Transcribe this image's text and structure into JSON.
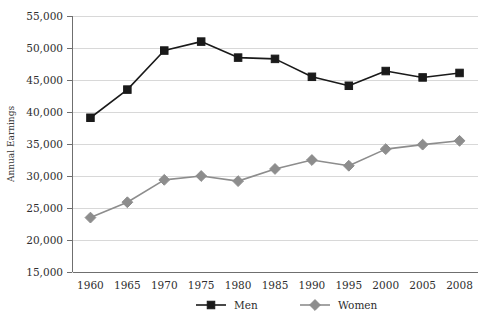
{
  "chart_data": {
    "type": "line",
    "title": "",
    "xlabel": "",
    "ylabel": "Annual Earnings",
    "x": [
      "1960",
      "1965",
      "1970",
      "1975",
      "1980",
      "1985",
      "1990",
      "1995",
      "2000",
      "2005",
      "2008"
    ],
    "categories": [
      "1960",
      "1965",
      "1970",
      "1975",
      "1980",
      "1985",
      "1990",
      "1995",
      "2000",
      "2005",
      "2008"
    ],
    "series": [
      {
        "name": "Men",
        "marker": "square",
        "color": "#1a1a1a",
        "values": [
          39100,
          43500,
          49600,
          51000,
          48500,
          48300,
          45500,
          44100,
          46400,
          45400,
          46100
        ]
      },
      {
        "name": "Women",
        "marker": "diamond",
        "color": "#8d8d8d",
        "values": [
          23500,
          25900,
          29400,
          30000,
          29200,
          31100,
          32500,
          31600,
          34200,
          34900,
          35500
        ]
      }
    ],
    "ylim": [
      15000,
      55000
    ],
    "ytick_step": 5000,
    "ytick_labels": [
      "15,000",
      "20,000",
      "25,000",
      "30,000",
      "35,000",
      "40,000",
      "45,000",
      "50,000",
      "55,000"
    ],
    "ytick_values": [
      15000,
      20000,
      25000,
      30000,
      35000,
      40000,
      45000,
      50000,
      55000
    ],
    "grid": true,
    "grid_axis": "y",
    "legend_position": "bottom",
    "legend_entries": [
      "Men",
      "Women"
    ],
    "background_color": "#ffffff",
    "gridline_color": "#d8d8d8",
    "axis_color": "#6f6f6f"
  },
  "plot": {
    "left": 72,
    "right": 478,
    "top": 16,
    "bottom": 272
  }
}
